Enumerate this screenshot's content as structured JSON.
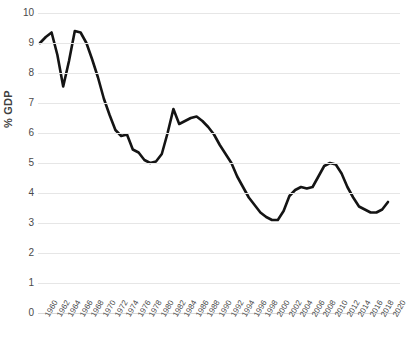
{
  "chart_data": {
    "type": "line",
    "title": "",
    "subtitle": "",
    "xlabel": "",
    "ylabel": "% GDP",
    "ylim": [
      0,
      10
    ],
    "xlim": [
      1960,
      2020
    ],
    "ytick_step": 1,
    "xtick_step": 2,
    "grid": true,
    "legend": "none",
    "line_color": "#141414",
    "grid_color": "#e6e6e6",
    "tick_label_color": "#4a4a4a",
    "yticks": [
      "0",
      "1",
      "2",
      "3",
      "4",
      "5",
      "6",
      "7",
      "8",
      "9",
      "10"
    ],
    "xticks": [
      "1960",
      "1962",
      "1964",
      "1966",
      "1968",
      "1970",
      "1972",
      "1974",
      "1976",
      "1978",
      "1980",
      "1982",
      "1984",
      "1986",
      "1988",
      "1990",
      "1992",
      "1994",
      "1996",
      "1998",
      "2000",
      "2002",
      "2004",
      "2006",
      "2008",
      "2010",
      "2012",
      "2014",
      "2016",
      "2018",
      "2020"
    ],
    "series": [
      {
        "name": "% GDP",
        "x": [
          1960,
          1961,
          1962,
          1963,
          1964,
          1965,
          1966,
          1967,
          1968,
          1969,
          1970,
          1971,
          1972,
          1973,
          1974,
          1975,
          1976,
          1977,
          1978,
          1979,
          1980,
          1981,
          1982,
          1983,
          1984,
          1985,
          1986,
          1987,
          1988,
          1989,
          1990,
          1991,
          1992,
          1993,
          1994,
          1995,
          1996,
          1997,
          1998,
          1999,
          2000,
          2001,
          2002,
          2003,
          2004,
          2005,
          2006,
          2007,
          2008,
          2009,
          2010,
          2011,
          2012,
          2013,
          2014,
          2015,
          2016,
          2017,
          2018,
          2019,
          2020
        ],
        "values": [
          9.0,
          9.2,
          9.35,
          8.6,
          7.55,
          8.4,
          9.4,
          9.35,
          9.0,
          8.45,
          7.85,
          7.15,
          6.6,
          6.1,
          5.9,
          5.95,
          5.45,
          5.35,
          5.1,
          5.0,
          5.05,
          5.3,
          6.0,
          6.8,
          6.3,
          6.4,
          6.5,
          6.55,
          6.4,
          6.2,
          5.95,
          5.6,
          5.3,
          5.0,
          4.55,
          4.2,
          3.85,
          3.6,
          3.35,
          3.2,
          3.1,
          3.1,
          3.4,
          3.9,
          4.1,
          4.2,
          4.15,
          4.2,
          4.55,
          4.9,
          5.0,
          4.95,
          4.65,
          4.2,
          3.85,
          3.55,
          3.45,
          3.35,
          3.35,
          3.45,
          3.7
        ]
      }
    ]
  }
}
